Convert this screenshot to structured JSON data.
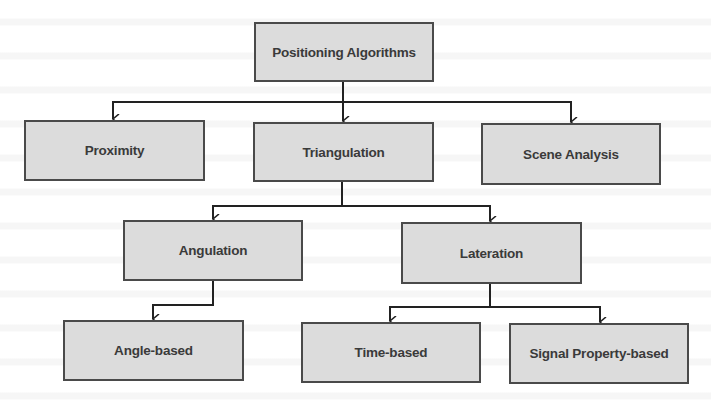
{
  "diagram": {
    "title": "Positioning Algorithms",
    "colors": {
      "box_fill": "#dcdcdc",
      "box_border": "#4a4a4a",
      "connector": "#222222",
      "text": "#3a3a3a"
    },
    "nodes": [
      {
        "id": "root",
        "label": "Positioning Algorithms",
        "x": 254,
        "y": 22,
        "w": 180,
        "h": 60
      },
      {
        "id": "proximity",
        "label": "Proximity",
        "x": 24,
        "y": 120,
        "w": 181,
        "h": 61
      },
      {
        "id": "triangulation",
        "label": "Triangulation",
        "x": 253,
        "y": 122,
        "w": 181,
        "h": 60
      },
      {
        "id": "scene-analysis",
        "label": "Scene Analysis",
        "x": 481,
        "y": 123,
        "w": 180,
        "h": 62
      },
      {
        "id": "angulation",
        "label": "Angulation",
        "x": 123,
        "y": 220,
        "w": 180,
        "h": 61
      },
      {
        "id": "lateration",
        "label": "Lateration",
        "x": 401,
        "y": 222,
        "w": 181,
        "h": 62
      },
      {
        "id": "angle-based",
        "label": "Angle-based",
        "x": 63,
        "y": 320,
        "w": 181,
        "h": 61
      },
      {
        "id": "time-based",
        "label": "Time-based",
        "x": 301,
        "y": 322,
        "w": 180,
        "h": 61
      },
      {
        "id": "signal-property-based",
        "label": "Signal Property-based",
        "x": 509,
        "y": 323,
        "w": 180,
        "h": 61
      }
    ],
    "edges": [
      {
        "from": "root",
        "to": "proximity"
      },
      {
        "from": "root",
        "to": "triangulation"
      },
      {
        "from": "root",
        "to": "scene-analysis"
      },
      {
        "from": "triangulation",
        "to": "angulation"
      },
      {
        "from": "triangulation",
        "to": "lateration"
      },
      {
        "from": "angulation",
        "to": "angle-based"
      },
      {
        "from": "lateration",
        "to": "time-based"
      },
      {
        "from": "lateration",
        "to": "signal-property-based"
      }
    ]
  }
}
